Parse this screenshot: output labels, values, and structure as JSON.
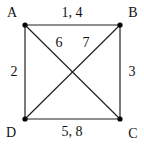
{
  "diagram": {
    "type": "graph",
    "vertices": [
      {
        "id": "A",
        "label": "A",
        "x": 25,
        "y": 25
      },
      {
        "id": "B",
        "label": "B",
        "x": 120,
        "y": 25
      },
      {
        "id": "C",
        "label": "C",
        "x": 120,
        "y": 119
      },
      {
        "id": "D",
        "label": "D",
        "x": 25,
        "y": 119
      }
    ],
    "edges": [
      {
        "from": "A",
        "to": "B",
        "label": "1, 4"
      },
      {
        "from": "A",
        "to": "D",
        "label": "2"
      },
      {
        "from": "B",
        "to": "C",
        "label": "3"
      },
      {
        "from": "D",
        "to": "C",
        "label": "5, 8"
      },
      {
        "from": "A",
        "to": "C",
        "label": "6"
      },
      {
        "from": "D",
        "to": "B",
        "label": "7"
      }
    ],
    "colors": {
      "line": "#222222",
      "vertex": "#000000",
      "background": "#ffffff"
    }
  }
}
